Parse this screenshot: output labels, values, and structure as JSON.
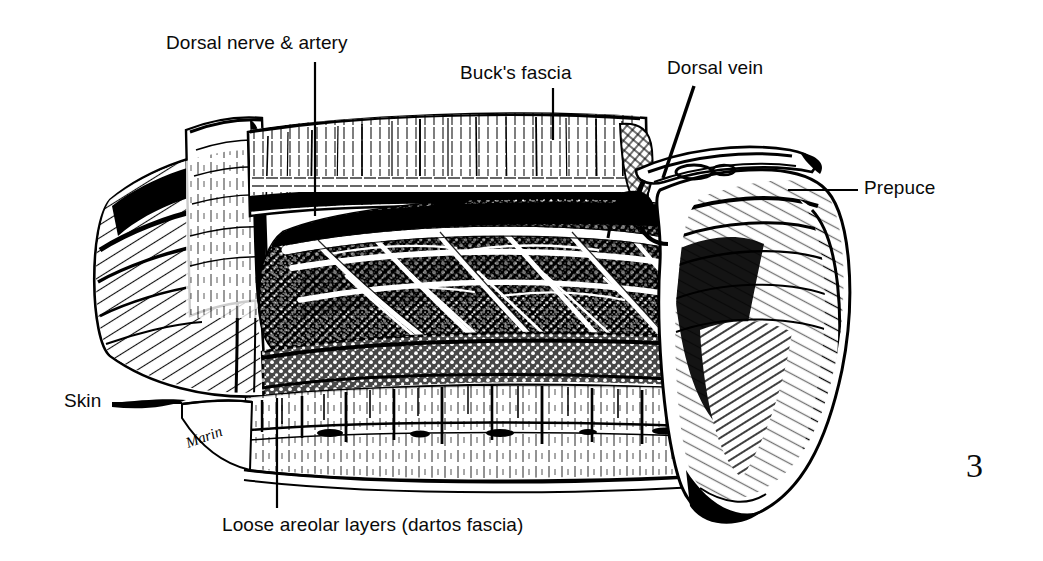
{
  "figure": {
    "number": "3",
    "caption_type": "anatomical-line-drawing",
    "medium": "pen-and-ink line engraving",
    "ink_color": "#000000",
    "paper_color": "#ffffff",
    "artist_signature": "Marin"
  },
  "labels": [
    {
      "id": "dorsal-nerve-artery",
      "text": "Dorsal nerve & artery",
      "x": 166,
      "y": 33
    },
    {
      "id": "bucks-fascia",
      "text": "Buck's fascia",
      "x": 460,
      "y": 63
    },
    {
      "id": "dorsal-vein",
      "text": "Dorsal vein",
      "x": 667,
      "y": 58
    },
    {
      "id": "prepuce",
      "text": "Prepuce",
      "x": 864,
      "y": 178
    },
    {
      "id": "skin",
      "text": "Skin",
      "x": 64,
      "y": 391
    },
    {
      "id": "loose-areolar",
      "text": "Loose areolar layers (dartos fascia)",
      "x": 222,
      "y": 515
    }
  ],
  "leaders": [
    {
      "id": "leader-dorsal-nerve-artery",
      "points": "315,62 315,216"
    },
    {
      "id": "leader-bucks-fascia",
      "points": "553,88 553,140"
    },
    {
      "id": "leader-dorsal-vein",
      "points": "694,86 663,178"
    },
    {
      "id": "leader-prepuce",
      "points": "858,190 788,190"
    },
    {
      "id": "leader-skin",
      "points": "112,403 182,403"
    },
    {
      "id": "leader-loose-areolar",
      "points": "277,508 277,398"
    }
  ],
  "figure_number_position": {
    "x": 966,
    "y": 449
  }
}
